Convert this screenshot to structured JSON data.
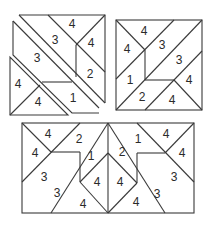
{
  "figures": [
    {
      "name": "figure-top-left",
      "description": "Square split into diagonal strip pieces, slightly separated",
      "labels": [
        {
          "text": "4",
          "x": 72,
          "y": 24
        },
        {
          "text": "4",
          "x": 91,
          "y": 43
        },
        {
          "text": "3",
          "x": 55,
          "y": 40
        },
        {
          "text": "3",
          "x": 37,
          "y": 58
        },
        {
          "text": "2",
          "x": 90,
          "y": 74
        },
        {
          "text": "1",
          "x": 73,
          "y": 98
        },
        {
          "text": "4",
          "x": 18,
          "y": 84
        },
        {
          "text": "4",
          "x": 38,
          "y": 102
        }
      ]
    },
    {
      "name": "figure-top-right",
      "description": "Square tiled with numbered pieces",
      "labels": [
        {
          "text": "4",
          "x": 144,
          "y": 31
        },
        {
          "text": "4",
          "x": 127,
          "y": 49
        },
        {
          "text": "3",
          "x": 162,
          "y": 45
        },
        {
          "text": "3",
          "x": 179,
          "y": 60
        },
        {
          "text": "4",
          "x": 189,
          "y": 80
        },
        {
          "text": "1",
          "x": 130,
          "y": 80
        },
        {
          "text": "2",
          "x": 142,
          "y": 97
        },
        {
          "text": "4",
          "x": 172,
          "y": 100
        }
      ]
    },
    {
      "name": "figure-bottom",
      "description": "Rectangle formed by two mirrored square tilings",
      "labels": [
        {
          "text": "4",
          "x": 48,
          "y": 134
        },
        {
          "text": "4",
          "x": 35,
          "y": 153
        },
        {
          "text": "2",
          "x": 79,
          "y": 139
        },
        {
          "text": "1",
          "x": 91,
          "y": 156
        },
        {
          "text": "3",
          "x": 44,
          "y": 177
        },
        {
          "text": "3",
          "x": 57,
          "y": 193
        },
        {
          "text": "4",
          "x": 97,
          "y": 182
        },
        {
          "text": "4",
          "x": 83,
          "y": 204
        },
        {
          "text": "1",
          "x": 138,
          "y": 139
        },
        {
          "text": "4",
          "x": 166,
          "y": 134
        },
        {
          "text": "2",
          "x": 122,
          "y": 152
        },
        {
          "text": "4",
          "x": 182,
          "y": 153
        },
        {
          "text": "3",
          "x": 174,
          "y": 177
        },
        {
          "text": "4",
          "x": 120,
          "y": 182
        },
        {
          "text": "3",
          "x": 157,
          "y": 194
        },
        {
          "text": "4",
          "x": 136,
          "y": 202
        }
      ]
    }
  ]
}
